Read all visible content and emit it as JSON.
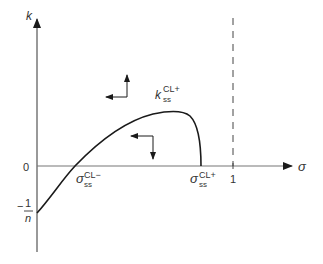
{
  "diagram": {
    "type": "phase-plane",
    "axes": {
      "y_label": "k",
      "x_label": "σ",
      "zero_label": "0",
      "x_tick_one": "1",
      "y_tick_neg": {
        "minus": "−",
        "numerator": "1",
        "denominator": "n"
      }
    },
    "curve_label": {
      "base": "k",
      "sub": "ss",
      "sup": "CL+"
    },
    "roots": [
      {
        "base": "σ",
        "sub": "ss",
        "sup": "CL−"
      },
      {
        "base": "σ",
        "sub": "ss",
        "sup": "CL+"
      }
    ],
    "vector_arrows": [
      {
        "region": "above-curve",
        "directions": [
          "left",
          "up"
        ]
      },
      {
        "region": "below-curve",
        "directions": [
          "left",
          "down"
        ]
      }
    ],
    "asymptote": {
      "x": "1",
      "style": "dashed"
    },
    "colors": {
      "line": "#1a1a1a",
      "axis": "#555555",
      "text": "#333333"
    }
  }
}
